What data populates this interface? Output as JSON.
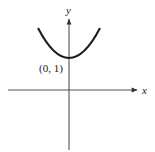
{
  "figure": {
    "type": "function-graph",
    "axes": {
      "x_label": "x",
      "y_label": "y"
    },
    "curve": {
      "shape": "parabola-opening-up",
      "vertex_label": "(0, 1)"
    },
    "colors": {
      "axis": "#333333",
      "curve": "#1a1a1a",
      "background": "#ffffff"
    }
  }
}
